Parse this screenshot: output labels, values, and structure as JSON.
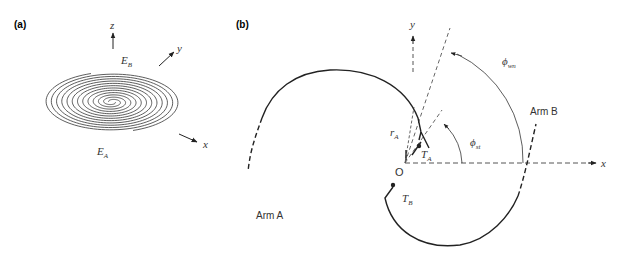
{
  "figure": {
    "panel_a": {
      "label": "(a)",
      "axes": {
        "z": "z",
        "y": "y",
        "x": "x"
      },
      "spiral_ends": {
        "outer_top": "E",
        "outer_top_sub": "B",
        "outer_bottom": "E",
        "outer_bottom_sub": "A"
      }
    },
    "panel_b": {
      "label": "(b)",
      "axes": {
        "y": "y",
        "x": "x"
      },
      "origin": "O",
      "arms": {
        "a": "Arm A",
        "b": "Arm B"
      },
      "terminals": {
        "ta": "T",
        "ta_sub": "A",
        "tb": "T",
        "tb_sub": "B"
      },
      "radius": {
        "label": "r",
        "sub": "A"
      },
      "angles": {
        "start": {
          "symbol": "ϕ",
          "sub": "st"
        },
        "wind": {
          "symbol": "ϕ",
          "sub": "wn"
        }
      }
    }
  },
  "colors": {
    "line": "#222222",
    "dashed": "#666666"
  }
}
